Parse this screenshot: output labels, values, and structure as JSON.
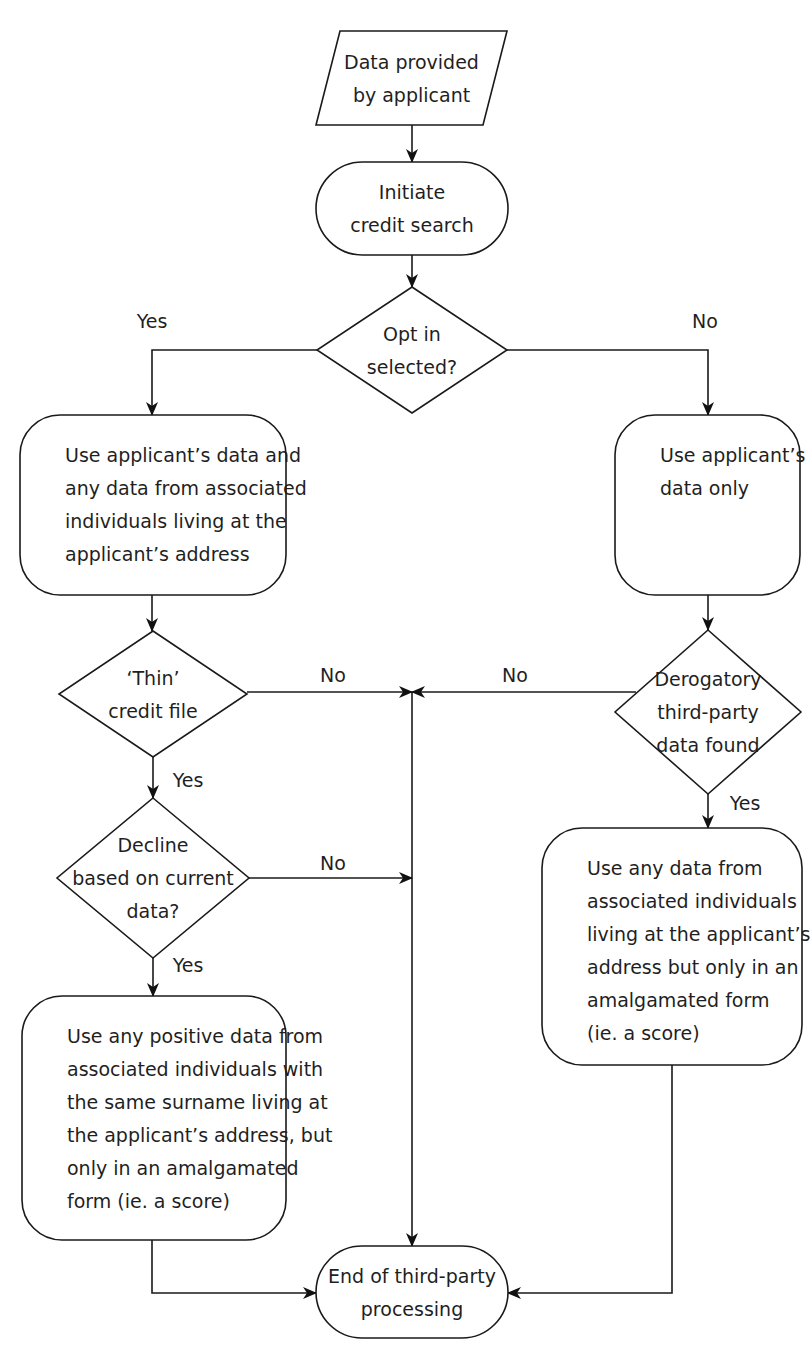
{
  "diagram": {
    "nodes": [
      {
        "id": "input",
        "type": "parallelogram",
        "lines": [
          "Data provided",
          "by applicant"
        ],
        "align": "center"
      },
      {
        "id": "initiate",
        "type": "terminator",
        "lines": [
          "Initiate",
          "credit search"
        ],
        "align": "center"
      },
      {
        "id": "optin",
        "type": "decision",
        "lines": [
          "Opt in",
          "selected?"
        ],
        "align": "center"
      },
      {
        "id": "use-assoc",
        "type": "process",
        "lines": [
          "Use applicant’s data and",
          "any data from associated",
          "individuals living at the",
          "applicant’s address"
        ],
        "align": "left"
      },
      {
        "id": "use-only",
        "type": "process",
        "lines": [
          "Use applicant’s",
          "data only"
        ],
        "align": "left"
      },
      {
        "id": "thin",
        "type": "decision",
        "lines": [
          "‘Thin’",
          "credit file"
        ],
        "align": "center"
      },
      {
        "id": "derog",
        "type": "decision",
        "lines": [
          "Derogatory",
          "third-party",
          "data found"
        ],
        "align": "center"
      },
      {
        "id": "decline",
        "type": "decision",
        "lines": [
          "Decline",
          "based on current",
          "data?"
        ],
        "align": "center"
      },
      {
        "id": "use-positive",
        "type": "process",
        "lines": [
          "Use any positive data from",
          "associated individuals with",
          "the same surname living at",
          "the applicant’s address, but",
          "only in an amalgamated",
          "form (ie. a score)"
        ],
        "align": "left"
      },
      {
        "id": "use-amalg",
        "type": "process",
        "lines": [
          "Use any data from",
          "associated individuals",
          "living at the applicant’s",
          "address but only in an",
          "amalgamated form",
          "(ie. a score)"
        ],
        "align": "left"
      },
      {
        "id": "end",
        "type": "terminator",
        "lines": [
          "End of third-party",
          "processing"
        ],
        "align": "center"
      }
    ],
    "edges": [
      {
        "from": "input",
        "to": "initiate",
        "label": ""
      },
      {
        "from": "initiate",
        "to": "optin",
        "label": ""
      },
      {
        "from": "optin",
        "to": "use-assoc",
        "label": "Yes"
      },
      {
        "from": "optin",
        "to": "use-only",
        "label": "No"
      },
      {
        "from": "use-assoc",
        "to": "thin",
        "label": ""
      },
      {
        "from": "use-only",
        "to": "derog",
        "label": ""
      },
      {
        "from": "thin",
        "to": "end",
        "label": "No"
      },
      {
        "from": "derog",
        "to": "end",
        "label": "No"
      },
      {
        "from": "thin",
        "to": "decline",
        "label": "Yes"
      },
      {
        "from": "derog",
        "to": "use-amalg",
        "label": "Yes"
      },
      {
        "from": "decline",
        "to": "end",
        "label": "No"
      },
      {
        "from": "decline",
        "to": "use-positive",
        "label": "Yes"
      },
      {
        "from": "use-positive",
        "to": "end",
        "label": ""
      },
      {
        "from": "use-amalg",
        "to": "end",
        "label": ""
      }
    ]
  }
}
